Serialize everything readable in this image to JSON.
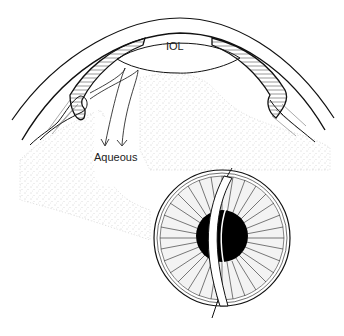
{
  "diagram": {
    "type": "anatomical-illustration",
    "labels": {
      "lens": "IOL",
      "fluid": "Aqueous"
    },
    "colors": {
      "ink": "#111111",
      "background": "#ffffff",
      "stipple": "#9a9a9a"
    }
  }
}
